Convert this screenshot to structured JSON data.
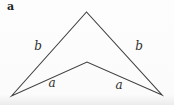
{
  "figure": {
    "panel_label": "a",
    "shape": "concave dart quadrilateral",
    "edge_labels": {
      "upper_left": "b",
      "upper_right": "b",
      "lower_left": "a",
      "lower_right": "a"
    },
    "colors": {
      "line": "#3f3f3f",
      "background": "#fbfbfb",
      "text": "#2e2e2e"
    }
  }
}
